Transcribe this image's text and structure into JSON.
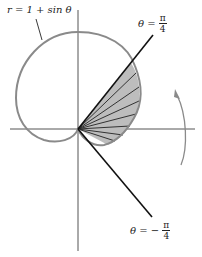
{
  "diagram": {
    "curve_label": "r = 1 + sin θ",
    "upper_ray_label": {
      "lhs": "θ =",
      "num": "π",
      "den": "4",
      "sign": ""
    },
    "lower_ray_label": {
      "lhs": "θ =",
      "num": "π",
      "den": "4",
      "sign": "−"
    },
    "colors": {
      "curve": "#8a8a8a",
      "axis": "#555555",
      "ray": "#111111",
      "shade": "#bdbdbd",
      "arrow": "#8a8a8a"
    },
    "annotation": "rotation arrow (counterclockwise)"
  }
}
